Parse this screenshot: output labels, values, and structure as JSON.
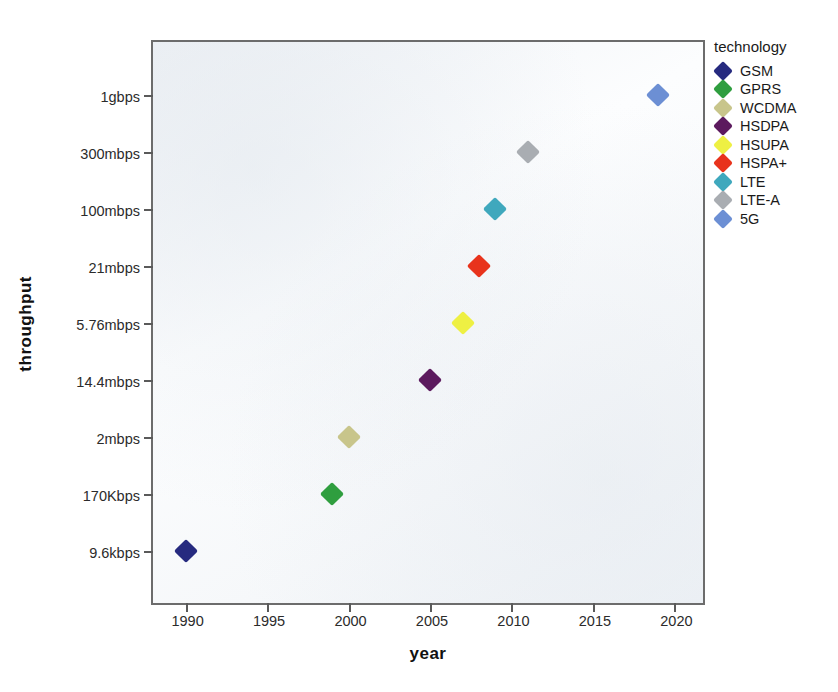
{
  "chart_data": {
    "type": "scatter",
    "title": "",
    "xlabel": "year",
    "ylabel": "throughput",
    "xlim": [
      1988,
      2022
    ],
    "ylim_categories": [
      "9.6kbps",
      "170Kbps",
      "2mbps",
      "14.4mbps",
      "5.76mbps",
      "21mbps",
      "100mbps",
      "300mbps",
      "1gbps"
    ],
    "x_ticks": [
      "1990",
      "1995",
      "2000",
      "2005",
      "2010",
      "2015",
      "2020"
    ],
    "x_tick_values": [
      1990,
      1995,
      2000,
      2005,
      2010,
      2015,
      2020
    ],
    "y_ticks_top_to_bottom": [
      "1gbps",
      "300mbps",
      "100mbps",
      "21mbps",
      "5.76mbps",
      "14.4mbps",
      "2mbps",
      "170Kbps",
      "9.6kbps"
    ],
    "grid": false,
    "legend_position": "right",
    "legend_title": "technology",
    "points": [
      {
        "label": "GSM",
        "year": 1990,
        "year_label": "1990",
        "throughput": "9.6kbps",
        "color": "#262a7f"
      },
      {
        "label": "GPRS",
        "year": 1999,
        "year_label": "1999",
        "throughput": "170Kbps",
        "color": "#2f9e3f"
      },
      {
        "label": "WCDMA",
        "year": 2000,
        "year_label": "2000",
        "throughput": "2mbps",
        "color": "#c8c58b"
      },
      {
        "label": "HSDPA",
        "year": 2005,
        "year_label": "2005",
        "throughput": "14.4mbps",
        "color": "#5c1a5e"
      },
      {
        "label": "HSUPA",
        "year": 2007,
        "year_label": "2007",
        "throughput": "5.76mbps",
        "color": "#eef043"
      },
      {
        "label": "HSPA+",
        "year": 2008,
        "year_label": "2008",
        "throughput": "21mbps",
        "color": "#e8331c"
      },
      {
        "label": "LTE",
        "year": 2009,
        "year_label": "2009",
        "throughput": "100mbps",
        "color": "#3fa8bd"
      },
      {
        "label": "LTE-A",
        "year": 2011,
        "year_label": "2011",
        "throughput": "300mbps",
        "color": "#a9adb2"
      },
      {
        "label": "5G",
        "year": 2019,
        "year_label": "2019",
        "throughput": "1gbps",
        "color": "#6c8fd4"
      }
    ],
    "series": [
      {
        "name": "GSM",
        "values": [
          1990,
          1
        ]
      },
      {
        "name": "GPRS",
        "values": [
          1999,
          2
        ]
      },
      {
        "name": "WCDMA",
        "values": [
          2000,
          3
        ]
      },
      {
        "name": "HSDPA",
        "values": [
          2005,
          4
        ]
      },
      {
        "name": "HSUPA",
        "values": [
          2007,
          5
        ]
      },
      {
        "name": "HSPA+",
        "values": [
          2008,
          6
        ]
      },
      {
        "name": "LTE",
        "values": [
          2009,
          7
        ]
      },
      {
        "name": "LTE-A",
        "values": [
          2011,
          8
        ]
      },
      {
        "name": "5G",
        "values": [
          2019,
          9
        ]
      }
    ]
  },
  "legend": {
    "title": "technology",
    "items": [
      {
        "label": "GSM",
        "color": "#262a7f"
      },
      {
        "label": "GPRS",
        "color": "#2f9e3f"
      },
      {
        "label": "WCDMA",
        "color": "#c8c58b"
      },
      {
        "label": "HSDPA",
        "color": "#5c1a5e"
      },
      {
        "label": "HSUPA",
        "color": "#eef043"
      },
      {
        "label": "HSPA+",
        "color": "#e8331c"
      },
      {
        "label": "LTE",
        "color": "#3fa8bd"
      },
      {
        "label": "LTE-A",
        "color": "#a9adb2"
      },
      {
        "label": "5G",
        "color": "#6c8fd4"
      }
    ]
  },
  "axes": {
    "x_title": "year",
    "y_title": "throughput"
  },
  "colors": {
    "plot_background": "#fbfcfd",
    "frame": "#6c6c6c",
    "text": "#1a1a1a"
  }
}
